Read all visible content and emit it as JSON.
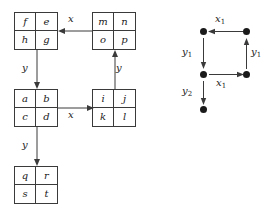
{
  "figure": {
    "ink_color": "#3a3a3a",
    "text_color": "#1a1a1a",
    "background": "#ffffff"
  },
  "left_diagram": {
    "name": "block-diagram",
    "boxes": [
      {
        "id": "box-top-left",
        "cells": {
          "tl": "f",
          "tr": "e",
          "bl": "h",
          "br": "g"
        }
      },
      {
        "id": "box-top-right",
        "cells": {
          "tl": "m",
          "tr": "n",
          "bl": "o",
          "br": "p"
        }
      },
      {
        "id": "box-middle-left",
        "cells": {
          "tl": "a",
          "tr": "b",
          "bl": "c",
          "br": "d"
        }
      },
      {
        "id": "box-middle-right",
        "cells": {
          "tl": "i",
          "tr": "j",
          "bl": "k",
          "br": "l"
        }
      },
      {
        "id": "box-bottom-left",
        "cells": {
          "tl": "q",
          "tr": "r",
          "bl": "s",
          "br": "t"
        }
      }
    ],
    "arrows": [
      {
        "id": "arrow-top-horizontal",
        "label": "x",
        "direction": "left",
        "from": "box-top-right",
        "to": "box-top-left"
      },
      {
        "id": "arrow-left-upper-vertical",
        "label": "y",
        "direction": "down",
        "from": "box-top-left",
        "to": "box-middle-left"
      },
      {
        "id": "arrow-right-vertical",
        "label": "y",
        "direction": "up",
        "from": "box-middle-right",
        "to": "box-top-right"
      },
      {
        "id": "arrow-middle-horizontal",
        "label": "x",
        "direction": "right",
        "from": "box-middle-left",
        "to": "box-middle-right"
      },
      {
        "id": "arrow-left-lower-vertical",
        "label": "y",
        "direction": "down",
        "from": "box-middle-left",
        "to": "box-bottom-left"
      }
    ]
  },
  "right_diagram": {
    "name": "lattice-path-diagram",
    "nodes": [
      {
        "id": "node-top-left"
      },
      {
        "id": "node-top-right"
      },
      {
        "id": "node-middle-left"
      },
      {
        "id": "node-middle-right"
      },
      {
        "id": "node-bottom-left"
      }
    ],
    "arrows": [
      {
        "id": "arrow-x1-top",
        "label_base": "x",
        "label_sub": "1",
        "direction": "left",
        "from": "node-top-right",
        "to": "node-top-left"
      },
      {
        "id": "arrow-y1-left",
        "label_base": "y",
        "label_sub": "1",
        "direction": "down",
        "from": "node-top-left",
        "to": "node-middle-left"
      },
      {
        "id": "arrow-y1-right",
        "label_base": "y",
        "label_sub": "1",
        "direction": "up",
        "from": "node-middle-right",
        "to": "node-top-right"
      },
      {
        "id": "arrow-x1-middle",
        "label_base": "x",
        "label_sub": "1",
        "direction": "right",
        "from": "node-middle-left",
        "to": "node-middle-right"
      },
      {
        "id": "arrow-y2-left",
        "label_base": "y",
        "label_sub": "2",
        "direction": "down",
        "from": "node-middle-left",
        "to": "node-bottom-left"
      }
    ]
  }
}
